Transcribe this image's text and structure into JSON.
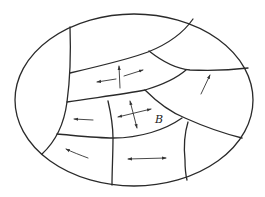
{
  "diagram": {
    "label_b": "B",
    "colors": {
      "line": "#2a2a2a",
      "background": "#ffffff"
    },
    "regions": [
      {
        "id": "left-cap",
        "arrows": []
      },
      {
        "id": "top-band",
        "arrows": []
      },
      {
        "id": "middle-band",
        "arrows": [
          "left",
          "right-up",
          "up"
        ]
      },
      {
        "id": "upper-right",
        "arrows": []
      },
      {
        "id": "right",
        "arrows": [
          "up-right"
        ]
      },
      {
        "id": "center-left",
        "arrows": [
          "left"
        ]
      },
      {
        "id": "center-B",
        "arrows": [
          "left-right",
          "up-down"
        ],
        "label": "B"
      },
      {
        "id": "bottom-left",
        "arrows": [
          "left-up"
        ]
      },
      {
        "id": "bottom-middle",
        "arrows": [
          "left-right"
        ]
      },
      {
        "id": "bottom-right",
        "arrows": []
      }
    ]
  }
}
